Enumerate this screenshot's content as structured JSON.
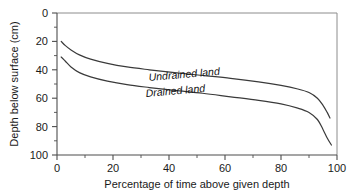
{
  "chart_data": {
    "type": "line",
    "title": "",
    "xlabel": "Percentage of time above given depth",
    "ylabel": "Depth below surface (cm)",
    "xlim": [
      0,
      100
    ],
    "ylim": [
      0,
      100
    ],
    "y_axis_inverted": true,
    "grid": false,
    "legend_position": "inline-labels",
    "x_ticks": [
      0,
      20,
      40,
      60,
      80,
      100
    ],
    "x_tick_labels": [
      "0",
      "20",
      "40",
      "60",
      "80",
      "100"
    ],
    "x_minor_tick_interval": 10,
    "y_ticks": [
      0,
      20,
      40,
      60,
      80,
      100
    ],
    "y_tick_labels": [
      "0",
      "20",
      "40",
      "60",
      "80",
      "100"
    ],
    "y_minor_tick_interval": 10,
    "series": [
      {
        "name": "Undrained land",
        "label": "Undrained land",
        "x": [
          1.5,
          3,
          5,
          8,
          12,
          18,
          25,
          33,
          42,
          52,
          62,
          72,
          80,
          86,
          90,
          93,
          95,
          96.5,
          97.5
        ],
        "values": [
          20,
          23,
          26,
          29.5,
          32.5,
          35.5,
          38,
          40,
          42,
          44,
          46,
          48.5,
          51,
          53.5,
          56,
          60,
          65,
          70,
          74
        ]
      },
      {
        "name": "Drained land",
        "label": "Drained land",
        "x": [
          1.5,
          3,
          5,
          8,
          12,
          18,
          25,
          33,
          42,
          52,
          62,
          72,
          80,
          86,
          90,
          93,
          95,
          96.5,
          98
        ],
        "values": [
          31,
          34,
          38,
          42,
          45,
          48,
          50.5,
          52.5,
          54.5,
          56.5,
          59,
          61.5,
          64,
          67,
          70,
          75,
          82,
          88,
          93
        ]
      }
    ],
    "colors": {
      "curve": "#3a3a3a",
      "axis": "#4d4d4d",
      "frame": "#8c8c8c",
      "text": "#1a1a1a",
      "background": "#ffffff"
    }
  }
}
